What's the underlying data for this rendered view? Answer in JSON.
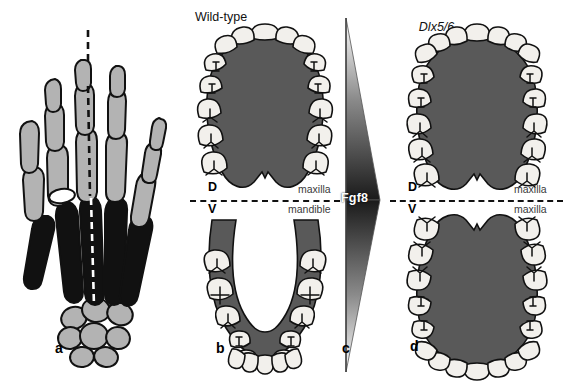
{
  "figure": {
    "panels": [
      {
        "id": "a",
        "letter": "a",
        "title": "",
        "subject": "human hand skeleton with dashed digit axis"
      },
      {
        "id": "b",
        "letter": "b",
        "title": "Wild-type",
        "title_italic": "",
        "title_plain": "Wild-type",
        "upper_label": "maxilla",
        "lower_label": "mandible",
        "axis_top": "D",
        "axis_bottom": "V"
      },
      {
        "id": "c",
        "letter": "c",
        "title": "",
        "signal": "Fgf8"
      },
      {
        "id": "d",
        "letter": "d",
        "title": "Dlx5/6 knockout",
        "title_italic": "Dlx5/6",
        "title_plain": "knockout",
        "upper_label": "maxilla",
        "lower_label": "maxilla",
        "axis_top": "D",
        "axis_bottom": "V"
      }
    ]
  },
  "hand": {
    "caption_letter": "a",
    "bone_groups": [
      {
        "name": "phalanges",
        "color": "#b3b3b3"
      },
      {
        "name": "metacarpals",
        "color": "#111111"
      },
      {
        "name": "carpals",
        "color": "#b3b3b3"
      }
    ],
    "axis_line": "dashed vertical axis through third digit"
  },
  "wildtype": {
    "letter": "b",
    "title": "Wild-type",
    "axis_top": "D",
    "axis_bottom": "V",
    "upper_jaw": "maxilla",
    "lower_jaw": "mandible",
    "upper_arch": {
      "shape": "maxillary arch, broad oval with posterior notch",
      "anterior_teeth_count": 6,
      "posterior_teeth_per_side": [
        "canine",
        "premolar",
        "premolar",
        "molar",
        "molar"
      ]
    },
    "lower_arch": {
      "shape": "mandibular arch, U-shaped (parabolic)",
      "anterior_teeth_count": 6,
      "posterior_teeth_per_side": [
        "molar",
        "molar",
        "premolar",
        "premolar",
        "canine"
      ]
    }
  },
  "knockout": {
    "letter": "d",
    "title_italic": "Dlx5/6",
    "title_plain": "knockout",
    "axis_top": "D",
    "axis_bottom": "V",
    "upper_jaw": "maxilla",
    "lower_jaw": "maxilla",
    "upper_arch": {
      "shape": "maxillary arch, broad oval with posterior notch",
      "anterior_teeth_count": 8,
      "posterior_teeth_per_side": [
        "canine",
        "premolar",
        "premolar",
        "molar",
        "molar"
      ]
    },
    "lower_arch": {
      "shape": "mirrored maxillary arch (mandible transformed to maxilla)",
      "anterior_teeth_count": 8,
      "posterior_teeth_per_side": [
        "molar",
        "molar",
        "premolar",
        "premolar",
        "canine"
      ]
    }
  },
  "signal": {
    "letter": "c",
    "name": "Fgf8",
    "shape": "bowtie / double-triangle gradient, darkest at midline",
    "gradient_dark": "#1a1a1a",
    "gradient_light": "#ffffff"
  },
  "colors": {
    "tissue": "#595959",
    "tooth": "#f2f0ec",
    "outline": "#111111",
    "bone_light": "#b3b3b3",
    "bone_dark": "#111111",
    "jaw_text": "#3a3a3a"
  }
}
